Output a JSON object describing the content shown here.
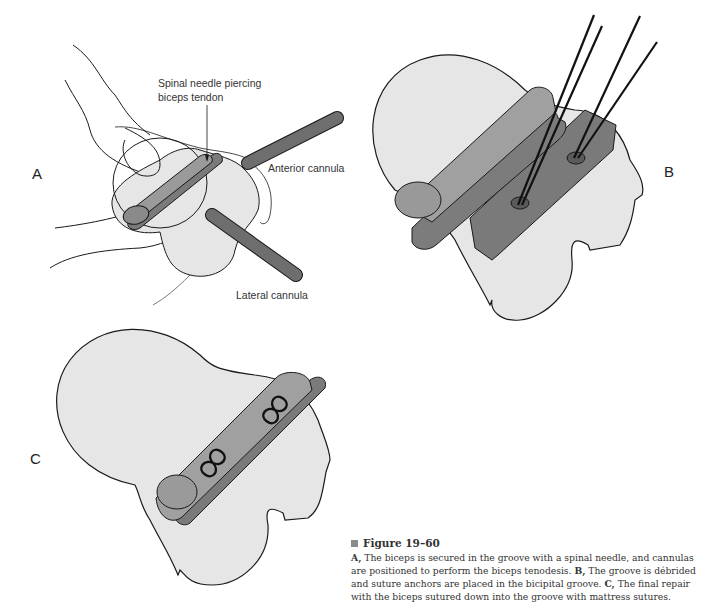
{
  "figure": {
    "number": "Figure 19–60",
    "marker_color": "#8a8a8a",
    "caption": [
      {
        "label": "A,",
        "text": " The biceps is secured in the groove with a spinal needle, and cannulas are positioned to perform the biceps tenodesis. "
      },
      {
        "label": "B,",
        "text": " The groove is débrided and suture anchors are placed in the bicipital groove. "
      },
      {
        "label": "C,",
        "text": " The final repair with the biceps sutured down into the groove with mattress sutures."
      }
    ]
  },
  "panels": {
    "a": {
      "letter": "A",
      "labels": {
        "needle_line1": "Spinal needle piercing",
        "needle_line2": "biceps tendon",
        "anterior": "Anterior cannula",
        "lateral": "Lateral cannula"
      }
    },
    "b": {
      "letter": "B"
    },
    "c": {
      "letter": "C"
    }
  },
  "colors": {
    "bone_fill": "#e6e6e6",
    "outline": "#1a1a1a",
    "tendon_fill": "#9a9a9a",
    "groove_fill": "#7a7a7a",
    "cannula_fill": "#6e6e6e"
  }
}
